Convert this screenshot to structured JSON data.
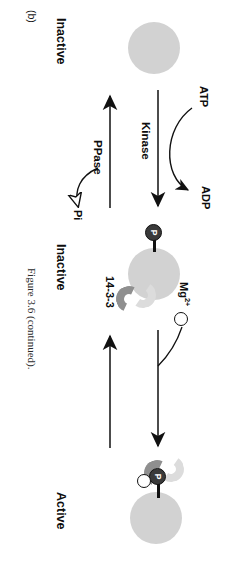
{
  "figure": {
    "panel_label": "(b)",
    "caption": "Figure 3.6 (continued)."
  },
  "states": [
    {
      "id": "state-left",
      "label": "Inactive",
      "note": "unmodified protein"
    },
    {
      "id": "state-middle",
      "label": "Inactive",
      "note": "phosphorylated protein"
    },
    {
      "id": "state-right",
      "label": "Active",
      "note": "phosphorylated protein with Mg2+ and 14-3-3"
    }
  ],
  "molecules": {
    "phosphate_label": "P",
    "magnesium_label": "Mg",
    "magnesium_charge": "2+",
    "scaffold_label": "14-3-3"
  },
  "reactions": [
    {
      "id": "phosphorylation",
      "enzyme": "Kinase",
      "substrate": "ATP",
      "product": "ADP",
      "direction": "left-to-right"
    },
    {
      "id": "dephosphorylation",
      "enzyme": "PPase",
      "product": "Pi",
      "direction": "right-to-left"
    },
    {
      "id": "activation",
      "enzyme": "",
      "cofactor": "Mg2+",
      "direction": "left-to-right"
    },
    {
      "id": "inactivation",
      "enzyme": "",
      "direction": "right-to-left"
    }
  ],
  "colors": {
    "protein_fill": "#d2d2d2",
    "phosphate_fill": "#3a3a3a",
    "scaffold_fill": "#8f8f8f",
    "ion_stroke": "#111111",
    "arrow_stroke": "#111111",
    "text": "#0d0d0d"
  }
}
